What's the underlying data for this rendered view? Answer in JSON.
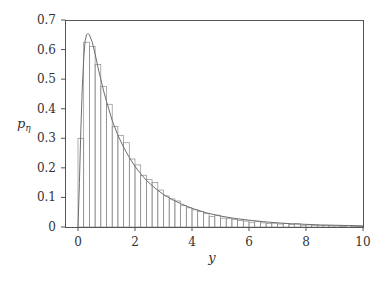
{
  "chart_data": {
    "type": "bar",
    "subtype": "histogram_with_density_curve",
    "title": "",
    "xlabel": "y",
    "ylabel": "p_η",
    "ylabel_main": "p",
    "ylabel_sub": "η",
    "xlim": [
      0,
      10
    ],
    "ylim": [
      0,
      0.7
    ],
    "xticks": [
      0,
      2,
      4,
      6,
      8,
      10
    ],
    "yticks": [
      0,
      0.1,
      0.2,
      0.3,
      0.4,
      0.5,
      0.6,
      0.7
    ],
    "xtick_labels": [
      "0",
      "2",
      "4",
      "6",
      "8",
      "10"
    ],
    "ytick_labels": [
      "0",
      "0.1",
      "0.2",
      "0.3",
      "0.4",
      "0.5",
      "0.6",
      "0.7"
    ],
    "grid": false,
    "legend": null,
    "bin_width": 0.2,
    "bins": {
      "left_edges": [
        0,
        0.2,
        0.4,
        0.6,
        0.8,
        1.0,
        1.2,
        1.4,
        1.6,
        1.8,
        2.0,
        2.2,
        2.4,
        2.6,
        2.8,
        3.0,
        3.2,
        3.4,
        3.6,
        3.8,
        4.0,
        4.2,
        4.4,
        4.6,
        4.8,
        5.0,
        5.2,
        5.4,
        5.6,
        5.8,
        6.0,
        6.2,
        6.4,
        6.6,
        6.8,
        7.0,
        7.2,
        7.4,
        7.6,
        7.8,
        8.0,
        8.2,
        8.4,
        8.6,
        8.8,
        9.0,
        9.2,
        9.4,
        9.6,
        9.8
      ],
      "values": [
        0.3,
        0.625,
        0.61,
        0.55,
        0.475,
        0.415,
        0.34,
        0.31,
        0.285,
        0.23,
        0.21,
        0.175,
        0.16,
        0.15,
        0.125,
        0.105,
        0.095,
        0.088,
        0.072,
        0.065,
        0.058,
        0.052,
        0.045,
        0.035,
        0.04,
        0.03,
        0.028,
        0.025,
        0.022,
        0.02,
        0.016,
        0.018,
        0.014,
        0.012,
        0.013,
        0.01,
        0.012,
        0.008,
        0.011,
        0.006,
        0.007,
        0.006,
        0.005,
        0.005,
        0.004,
        0.004,
        0.003,
        0.004,
        0.003,
        0.002
      ]
    },
    "curve": {
      "x": [
        0,
        0.05,
        0.1,
        0.15,
        0.2,
        0.25,
        0.3,
        0.35,
        0.4,
        0.5,
        0.6,
        0.7,
        0.8,
        0.9,
        1.0,
        1.2,
        1.4,
        1.6,
        1.8,
        2.0,
        2.2,
        2.4,
        2.6,
        2.8,
        3.0,
        3.3,
        3.6,
        4.0,
        4.5,
        5.0,
        5.5,
        6.0,
        6.5,
        7.0,
        7.5,
        8.0,
        8.5,
        9.0,
        9.5,
        10.0
      ],
      "y": [
        0,
        0.15,
        0.33,
        0.47,
        0.57,
        0.63,
        0.65,
        0.655,
        0.65,
        0.625,
        0.585,
        0.54,
        0.5,
        0.46,
        0.425,
        0.36,
        0.31,
        0.27,
        0.235,
        0.205,
        0.18,
        0.158,
        0.14,
        0.124,
        0.11,
        0.093,
        0.079,
        0.063,
        0.048,
        0.037,
        0.029,
        0.023,
        0.018,
        0.014,
        0.011,
        0.009,
        0.007,
        0.006,
        0.005,
        0.004
      ]
    },
    "colors": {
      "bar_stroke": "#8c8c8c",
      "curve": "#6e6e6e",
      "axis": "#555555"
    }
  }
}
